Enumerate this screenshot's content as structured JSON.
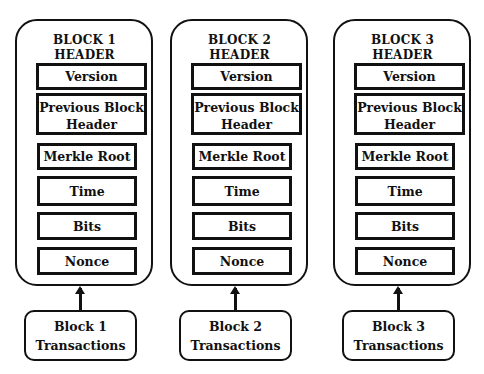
{
  "diagram": {
    "blocks": [
      {
        "header_title_line1": "BLOCK 1",
        "header_title_line2": "HEADER",
        "fields": {
          "version": "Version",
          "previous_block_header": "Previous Block Header",
          "merkle_root": "Merkle Root",
          "time": "Time",
          "bits": "Bits",
          "nonce": "Nonce"
        },
        "transactions_line1": "Block 1",
        "transactions_line2": "Transactions"
      },
      {
        "header_title_line1": "BLOCK 2",
        "header_title_line2": "HEADER",
        "fields": {
          "version": "Version",
          "previous_block_header": "Previous Block Header",
          "merkle_root": "Merkle Root",
          "time": "Time",
          "bits": "Bits",
          "nonce": "Nonce"
        },
        "transactions_line1": "Block 2",
        "transactions_line2": "Transactions"
      },
      {
        "header_title_line1": "BLOCK 3",
        "header_title_line2": "HEADER",
        "fields": {
          "version": "Version",
          "previous_block_header": "Previous Block Header",
          "merkle_root": "Merkle Root",
          "time": "Time",
          "bits": "Bits",
          "nonce": "Nonce"
        },
        "transactions_line1": "Block 3",
        "transactions_line2": "Transactions"
      }
    ],
    "colors": {
      "stroke": "#111111",
      "background": "#ffffff"
    }
  }
}
